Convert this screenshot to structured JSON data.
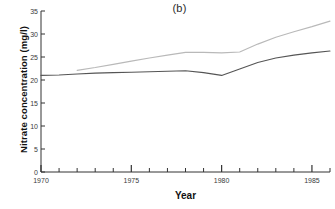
{
  "chart_data": {
    "type": "line",
    "title": "(b)",
    "xlabel": "Year",
    "ylabel": "Nitrate concentration (mg/l)",
    "xlim": [
      1970,
      1986
    ],
    "ylim": [
      0,
      35
    ],
    "yticks": [
      0,
      5,
      10,
      15,
      20,
      25,
      30,
      35
    ],
    "ytick_labels": [
      "0",
      "5",
      "10",
      "15",
      "20",
      "25",
      "30",
      "35"
    ],
    "xticks_major": [
      1970,
      1975,
      1980,
      1985
    ],
    "xtick_labels": [
      "1970",
      "1975",
      "1980",
      "1985"
    ],
    "xticks_minor": [
      1971,
      1972,
      1973,
      1974,
      1976,
      1977,
      1978,
      1979,
      1981,
      1982,
      1983,
      1984,
      1986
    ],
    "grid": false,
    "legend": null,
    "series": [
      {
        "name": "lower-series",
        "color": "#555555",
        "x": [
          1970,
          1971,
          1972,
          1973,
          1974,
          1975,
          1976,
          1977,
          1978,
          1979,
          1980,
          1981,
          1982,
          1983,
          1984,
          1985,
          1986
        ],
        "values": [
          21.0,
          21.1,
          21.3,
          21.5,
          21.6,
          21.7,
          21.8,
          21.9,
          22.0,
          21.6,
          21.0,
          22.4,
          23.8,
          24.8,
          25.4,
          25.9,
          26.3
        ]
      },
      {
        "name": "upper-series",
        "color": "#b9b9b9",
        "x": [
          1972,
          1973,
          1974,
          1975,
          1976,
          1977,
          1978,
          1979,
          1980,
          1981,
          1982,
          1983,
          1984,
          1985,
          1986
        ],
        "values": [
          22.1,
          22.7,
          23.4,
          24.1,
          24.8,
          25.4,
          26.0,
          26.0,
          25.9,
          26.1,
          27.8,
          29.3,
          30.5,
          31.6,
          32.8
        ]
      }
    ]
  }
}
